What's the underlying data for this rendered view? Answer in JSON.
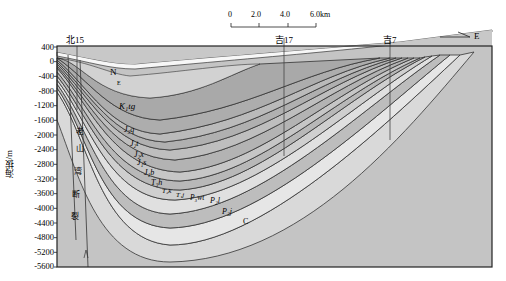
{
  "scale_bar": {
    "ticks": [
      "0",
      "2.0",
      "4.0",
      "6.0km"
    ]
  },
  "direction": {
    "label": "E"
  },
  "y_axis": {
    "title": "海拔/m",
    "ticks": [
      "400",
      "0",
      "-400",
      "-800",
      "-1200",
      "-1600",
      "-2000",
      "-2400",
      "-2800",
      "-3200",
      "-3600",
      "-4000",
      "-4400",
      "-4800",
      "-5200",
      "-5600"
    ]
  },
  "wells": [
    {
      "name": "北15"
    },
    {
      "name": "吉17"
    },
    {
      "name": "吉7"
    }
  ],
  "fault": {
    "chars": [
      "老",
      "山",
      "湾",
      "断",
      "裂"
    ]
  },
  "strata": {
    "N": "N",
    "E": "E",
    "K1tg": "K₁tg",
    "J3q": "J₃q",
    "J2t": "J₂t",
    "J2x": "J₂x",
    "J1s": "J₁s",
    "J1b": "J₁b",
    "T3h": "T₃h",
    "T2k": "T₂k",
    "T1j": "T₁j",
    "P3wt": "P₃wt",
    "P2l": "P₂l",
    "P2j": "P₂j",
    "C": "C"
  },
  "chart_data": {
    "type": "geologic-cross-section",
    "title": "",
    "ylabel": "海拔/m",
    "ylim": [
      -5600,
      400
    ],
    "yticks": [
      400,
      0,
      -400,
      -800,
      -1200,
      -1600,
      -2000,
      -2400,
      -2800,
      -3200,
      -3600,
      -4000,
      -4400,
      -4800,
      -5200,
      -5600
    ],
    "scale_km": [
      0,
      2.0,
      4.0,
      6.0
    ],
    "orientation": "W-E",
    "wells": [
      "北15",
      "吉17",
      "吉7"
    ],
    "units": [
      "N",
      "E",
      "K1tg",
      "J3q",
      "J2t",
      "J2x",
      "J1s",
      "J1b",
      "T3h",
      "T2k",
      "T1j",
      "P3wt",
      "P2l",
      "P2j",
      "C"
    ]
  }
}
